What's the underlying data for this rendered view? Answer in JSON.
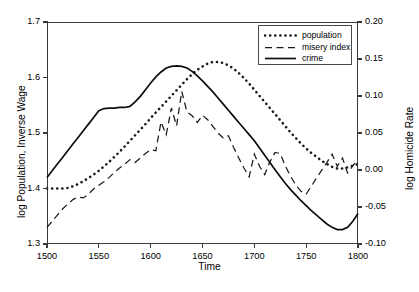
{
  "chart_data": {
    "type": "line",
    "title": "",
    "xlabel": "Time",
    "ylabel": "log Population, Inverse Wage",
    "ylabel_right": "log Homicide Rate",
    "xlim": [
      1500,
      1800
    ],
    "ylim": [
      1.3,
      1.7
    ],
    "ylim_right": [
      -0.1,
      0.2
    ],
    "xticks": [
      "1500",
      "1550",
      "1600",
      "1650",
      "1700",
      "1750",
      "1800"
    ],
    "yticks_left": [
      "1.3",
      "1.4",
      "1.5",
      "1.6",
      "1.7"
    ],
    "yticks_right": [
      "-0.10",
      "-0.05",
      "0.00",
      "0.05",
      "0.10",
      "0.15",
      "0.20"
    ],
    "grid": false,
    "legend_position": "top-right",
    "legend": [
      "population",
      "misery index",
      "crime"
    ],
    "series": [
      {
        "name": "population",
        "style": "dotted",
        "axis": "left",
        "x": [
          1500,
          1505,
          1510,
          1515,
          1520,
          1525,
          1530,
          1535,
          1540,
          1545,
          1550,
          1555,
          1560,
          1565,
          1570,
          1575,
          1580,
          1585,
          1590,
          1595,
          1600,
          1605,
          1610,
          1615,
          1620,
          1625,
          1630,
          1635,
          1640,
          1645,
          1650,
          1655,
          1660,
          1665,
          1670,
          1675,
          1680,
          1685,
          1690,
          1695,
          1700,
          1705,
          1710,
          1715,
          1720,
          1725,
          1730,
          1735,
          1740,
          1745,
          1750,
          1755,
          1760,
          1765,
          1770,
          1775,
          1780,
          1785,
          1790,
          1795,
          1800
        ],
        "values": [
          1.4,
          1.4,
          1.4,
          1.4,
          1.401,
          1.404,
          1.408,
          1.413,
          1.419,
          1.425,
          1.432,
          1.44,
          1.448,
          1.457,
          1.466,
          1.476,
          1.486,
          1.496,
          1.506,
          1.516,
          1.527,
          1.537,
          1.547,
          1.557,
          1.567,
          1.577,
          1.587,
          1.597,
          1.606,
          1.614,
          1.62,
          1.625,
          1.628,
          1.628,
          1.626,
          1.622,
          1.616,
          1.608,
          1.599,
          1.589,
          1.578,
          1.567,
          1.556,
          1.545,
          1.534,
          1.523,
          1.512,
          1.501,
          1.491,
          1.481,
          1.472,
          1.464,
          1.457,
          1.45,
          1.444,
          1.439,
          1.436,
          1.436,
          1.438,
          1.441,
          1.444
        ]
      },
      {
        "name": "misery index",
        "style": "dashed",
        "axis": "left",
        "x": [
          1500,
          1505,
          1510,
          1515,
          1520,
          1525,
          1530,
          1535,
          1540,
          1545,
          1550,
          1555,
          1560,
          1565,
          1570,
          1575,
          1580,
          1585,
          1590,
          1595,
          1600,
          1605,
          1610,
          1615,
          1620,
          1625,
          1630,
          1635,
          1640,
          1645,
          1650,
          1655,
          1660,
          1665,
          1670,
          1675,
          1680,
          1685,
          1690,
          1695,
          1700,
          1705,
          1710,
          1715,
          1720,
          1725,
          1730,
          1735,
          1740,
          1745,
          1750,
          1755,
          1760,
          1765,
          1770,
          1775,
          1780,
          1785,
          1790,
          1795,
          1800
        ],
        "values": [
          1.33,
          1.341,
          1.352,
          1.363,
          1.372,
          1.38,
          1.385,
          1.383,
          1.39,
          1.399,
          1.406,
          1.412,
          1.42,
          1.429,
          1.437,
          1.444,
          1.452,
          1.447,
          1.455,
          1.463,
          1.47,
          1.468,
          1.52,
          1.497,
          1.545,
          1.513,
          1.575,
          1.538,
          1.531,
          1.519,
          1.532,
          1.524,
          1.512,
          1.5,
          1.491,
          1.495,
          1.474,
          1.455,
          1.437,
          1.421,
          1.462,
          1.44,
          1.425,
          1.448,
          1.465,
          1.463,
          1.44,
          1.422,
          1.406,
          1.395,
          1.39,
          1.404,
          1.419,
          1.433,
          1.447,
          1.462,
          1.44,
          1.455,
          1.428,
          1.441,
          1.452
        ]
      },
      {
        "name": "crime",
        "style": "solid",
        "axis": "right",
        "x": [
          1500,
          1505,
          1510,
          1515,
          1520,
          1525,
          1530,
          1535,
          1540,
          1545,
          1550,
          1555,
          1560,
          1565,
          1570,
          1575,
          1580,
          1585,
          1590,
          1595,
          1600,
          1605,
          1610,
          1615,
          1620,
          1625,
          1630,
          1635,
          1640,
          1645,
          1650,
          1655,
          1660,
          1665,
          1670,
          1675,
          1680,
          1685,
          1690,
          1695,
          1700,
          1705,
          1710,
          1715,
          1720,
          1725,
          1730,
          1735,
          1740,
          1745,
          1750,
          1755,
          1760,
          1765,
          1770,
          1775,
          1780,
          1785,
          1790,
          1795,
          1800
        ],
        "values": [
          1.42,
          1.432,
          1.444,
          1.456,
          1.468,
          1.48,
          1.492,
          1.504,
          1.516,
          1.528,
          1.54,
          1.544,
          1.545,
          1.545,
          1.546,
          1.546,
          1.548,
          1.556,
          1.566,
          1.578,
          1.59,
          1.601,
          1.61,
          1.617,
          1.62,
          1.621,
          1.62,
          1.617,
          1.611,
          1.603,
          1.594,
          1.584,
          1.574,
          1.563,
          1.552,
          1.541,
          1.53,
          1.519,
          1.508,
          1.497,
          1.486,
          1.473,
          1.46,
          1.447,
          1.434,
          1.421,
          1.409,
          1.398,
          1.388,
          1.378,
          1.369,
          1.36,
          1.352,
          1.344,
          1.336,
          1.33,
          1.326,
          1.326,
          1.33,
          1.341,
          1.355
        ]
      }
    ]
  }
}
